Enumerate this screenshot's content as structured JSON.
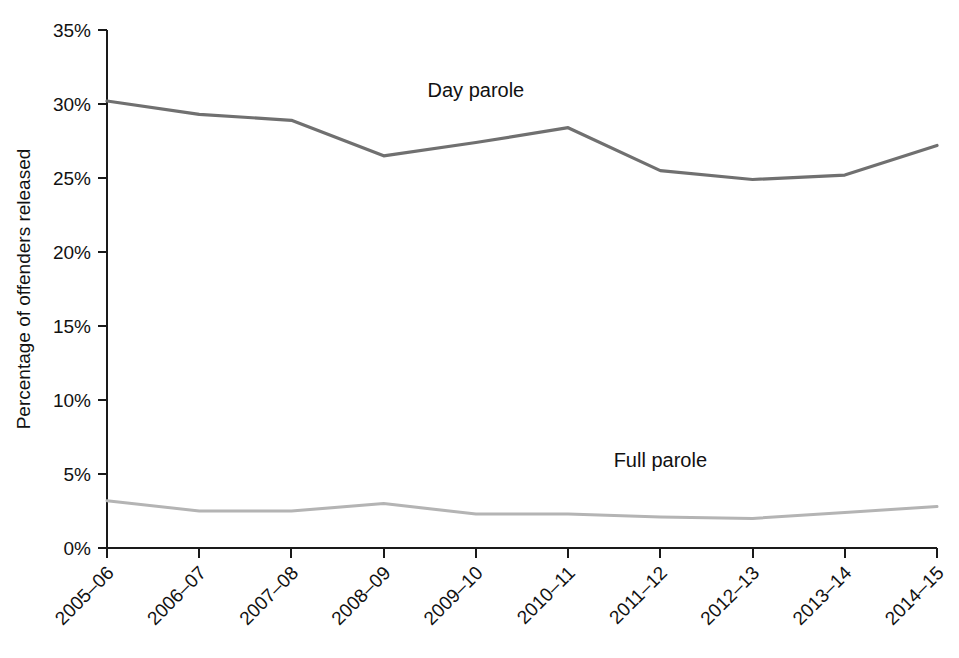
{
  "chart_data": {
    "type": "line",
    "title": "",
    "subtitle": "",
    "xlabel": "",
    "ylabel": "Percentage of offenders released",
    "categories": [
      "2005–06",
      "2006–07",
      "2007–08",
      "2008–09",
      "2009–10",
      "2010–11",
      "2011–12",
      "2012–13",
      "2013–14",
      "2014–15"
    ],
    "series": [
      {
        "name": "Day parole",
        "color": "#707070",
        "values": [
          30.2,
          29.3,
          28.9,
          26.5,
          27.4,
          28.4,
          25.5,
          24.9,
          25.2,
          27.2
        ],
        "label_text": "Day parole"
      },
      {
        "name": "Full parole",
        "color": "#b4b4b4",
        "values": [
          3.2,
          2.5,
          2.5,
          3.0,
          2.3,
          2.3,
          2.1,
          2.0,
          2.4,
          2.8
        ],
        "label_text": "Full parole"
      }
    ],
    "ylim": [
      0,
      35
    ],
    "ytick_values": [
      0,
      5,
      10,
      15,
      20,
      25,
      30,
      35
    ],
    "ytick_labels": [
      "0%",
      "5%",
      "10%",
      "15%",
      "20%",
      "25%",
      "30%",
      "35%"
    ],
    "grid": false,
    "legend_position": "inline-annotations",
    "annotations": [
      {
        "text": "Day parole",
        "x_index": 4,
        "y_value": 30.5
      },
      {
        "text": "Full parole",
        "x_index": 6,
        "y_value": 5.5
      }
    ]
  },
  "axis": {
    "y_title": "Percentage of offenders released"
  }
}
